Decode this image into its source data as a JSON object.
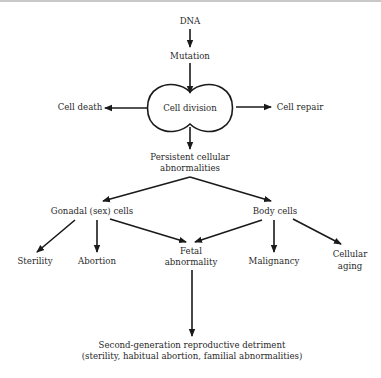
{
  "diagram": {
    "type": "flowchart",
    "nodes": {
      "dna": "DNA",
      "mutation": "Mutation",
      "cell_division": "Cell division",
      "cell_death": "Cell death",
      "cell_repair": "Cell repair",
      "persistent_line1": "Persistent cellular",
      "persistent_line2": "abnormalities",
      "gonadal": "Gonadal (sex) cells",
      "body": "Body cells",
      "sterility": "Sterility",
      "abortion": "Abortion",
      "fetal_line1": "Fetal",
      "fetal_line2": "abnormality",
      "malignancy": "Malignancy",
      "aging_line1": "Cellular",
      "aging_line2": "aging",
      "second_gen_line1": "Second-generation reproductive detriment",
      "second_gen_line2": "(sterility, habitual abortion, familial abnormalities)"
    },
    "edges": [
      [
        "DNA",
        "Mutation"
      ],
      [
        "Mutation",
        "Cell division"
      ],
      [
        "Cell division",
        "Cell death"
      ],
      [
        "Cell division",
        "Cell repair"
      ],
      [
        "Cell division",
        "Persistent cellular abnormalities"
      ],
      [
        "Persistent cellular abnormalities",
        "Gonadal (sex) cells"
      ],
      [
        "Persistent cellular abnormalities",
        "Body cells"
      ],
      [
        "Gonadal (sex) cells",
        "Sterility"
      ],
      [
        "Gonadal (sex) cells",
        "Abortion"
      ],
      [
        "Gonadal (sex) cells",
        "Fetal abnormality"
      ],
      [
        "Body cells",
        "Fetal abnormality"
      ],
      [
        "Body cells",
        "Malignancy"
      ],
      [
        "Body cells",
        "Cellular aging"
      ],
      [
        "Fetal abnormality",
        "Second-generation reproductive detriment"
      ]
    ],
    "colors": {
      "stroke": "#1a1a1a",
      "text": "#2a2a2a",
      "background": "#ffffff"
    }
  }
}
